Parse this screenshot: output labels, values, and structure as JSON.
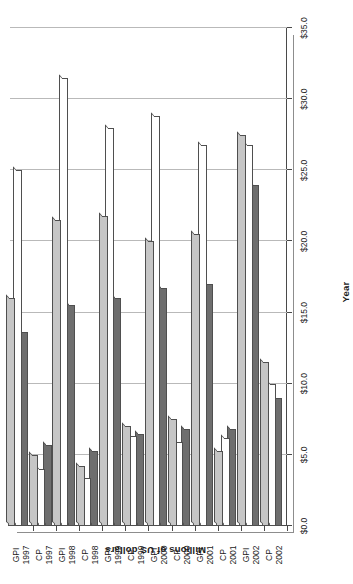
{
  "chart_data": {
    "type": "bar",
    "orientation": "horizontal-rotated",
    "title": "",
    "xlabel": "Year",
    "ylabel": "Millions of US dollars",
    "ylim": [
      0.0,
      35.0
    ],
    "ytick_values": [
      0.0,
      5.0,
      10.0,
      15.0,
      20.0,
      25.0,
      30.0,
      35.0
    ],
    "ytick_labels": [
      "$0.0",
      "$5.0",
      "$10.0",
      "$15.0",
      "$20.0",
      "$25.0",
      "$30.0",
      "$35.0"
    ],
    "grid": true,
    "legend": null,
    "categories": [
      "GPI 1997",
      "CP 1997",
      "GPI 1998",
      "CP 1998",
      "GPI 1999",
      "CP 1999",
      "GPI 2000",
      "CP 2000",
      "GPI 2001",
      "CP 2001",
      "GPI 2002",
      "CP 2002"
    ],
    "category_labels": [
      {
        "line1": "GPI",
        "line2": "1997"
      },
      {
        "line1": "CP",
        "line2": "1997"
      },
      {
        "line1": "GPI",
        "line2": "1998"
      },
      {
        "line1": "CP",
        "line2": "1998"
      },
      {
        "line1": "GPI",
        "line2": "1999"
      },
      {
        "line1": "CP",
        "line2": "1999"
      },
      {
        "line1": "GPI",
        "line2": "2000"
      },
      {
        "line1": "CP",
        "line2": "2000"
      },
      {
        "line1": "GPI",
        "line2": "2001"
      },
      {
        "line1": "CP",
        "line2": "2001"
      },
      {
        "line1": "GPI",
        "line2": "2002"
      },
      {
        "line1": "CP",
        "line2": "2002"
      }
    ],
    "series": [
      {
        "name": "Series 1",
        "color": "#6e6e6e",
        "values": [
          13.6,
          5.7,
          15.5,
          5.3,
          16.0,
          6.5,
          16.7,
          6.8,
          17.0,
          6.8,
          24.0,
          9.0
        ]
      },
      {
        "name": "Series 2",
        "color": "#ffffff",
        "values": [
          25.0,
          4.0,
          31.5,
          3.4,
          28.0,
          6.3,
          28.8,
          5.9,
          26.8,
          6.2,
          26.8,
          10.0
        ]
      },
      {
        "name": "Series 3",
        "color": "#c6c6c6",
        "values": [
          16.0,
          5.0,
          21.5,
          4.2,
          21.8,
          7.0,
          20.0,
          7.5,
          20.5,
          5.3,
          27.5,
          11.5
        ]
      }
    ]
  }
}
